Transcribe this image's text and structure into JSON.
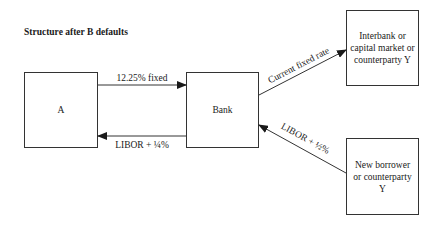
{
  "title": "Structure after B defaults",
  "nodes": {
    "a": {
      "label": "A"
    },
    "bank": {
      "label": "Bank"
    },
    "interbank": {
      "lines": [
        "Interbank or",
        "capital market or",
        "counterparty Y"
      ]
    },
    "new_borrower": {
      "lines": [
        "New borrower",
        "or counterparty",
        "Y"
      ]
    }
  },
  "edges": {
    "a_to_bank": {
      "label": "12.25% fixed",
      "from": "A",
      "to": "Bank"
    },
    "bank_to_a": {
      "label": "LIBOR + ¼%",
      "from": "Bank",
      "to": "A"
    },
    "bank_to_interbank": {
      "label": "Current fixed rate",
      "from": "Bank",
      "to": "Interbank or capital market or counterparty Y"
    },
    "new_borrower_to_bank": {
      "label": "LIBOR + ½%",
      "from": "New borrower or counterparty Y",
      "to": "Bank"
    }
  },
  "colors": {
    "line": "#333333",
    "text": "#1a1a1a",
    "background": "#ffffff"
  }
}
